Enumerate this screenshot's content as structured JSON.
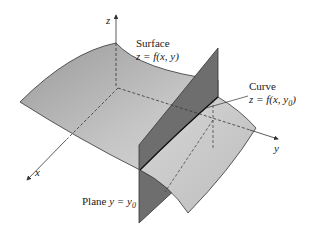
{
  "diagram": {
    "type": "3d-surface-with-plane-section",
    "axes": {
      "x_label": "x",
      "y_label": "y",
      "z_label": "z"
    },
    "surface": {
      "title": "Surface",
      "equation": "z = f(x, y)"
    },
    "curve": {
      "title": "Curve",
      "equation": "z = f(x, y0)",
      "equation_base": "z = f(x, y",
      "equation_sub": "0",
      "equation_end": ")"
    },
    "plane": {
      "title": "Plane",
      "equation_prefix": "y = y",
      "equation_sub": "0"
    },
    "colors": {
      "surface": "#b3b3b3",
      "surface_light": "#cfcfcf",
      "plane": "#6e6e6e",
      "edge": "#333333"
    }
  }
}
